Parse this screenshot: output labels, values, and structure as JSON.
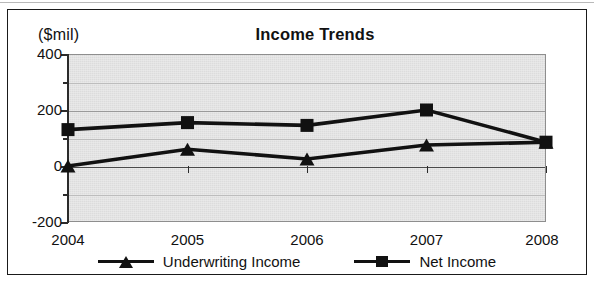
{
  "chart_data": {
    "type": "line",
    "title": "Income Trends",
    "xlabel": "",
    "ylabel": "($mil)",
    "ylim": [
      -200,
      400
    ],
    "yticks": [
      -200,
      0,
      200,
      400
    ],
    "ytick_labels": [
      "-200",
      "0",
      "200",
      "400"
    ],
    "yminor_ticks": [
      -100,
      100,
      300
    ],
    "grid": true,
    "legend_position": "bottom",
    "categories": [
      "2004",
      "2005",
      "2006",
      "2007",
      "2008"
    ],
    "series": [
      {
        "name": "Underwriting Income",
        "marker": "triangle",
        "color": "#111111",
        "values": [
          0,
          60,
          25,
          75,
          85
        ]
      },
      {
        "name": "Net Income",
        "marker": "square",
        "color": "#111111",
        "values": [
          130,
          155,
          145,
          200,
          85
        ]
      }
    ]
  },
  "axis_unit_label": "($mil)",
  "title": "Income Trends",
  "y_labels": [
    "400",
    "200",
    "0",
    "-200"
  ],
  "x_labels": [
    "2004",
    "2005",
    "2006",
    "2007",
    "2008"
  ],
  "legend": [
    {
      "label": "Underwriting Income",
      "marker": "triangle-marker"
    },
    {
      "label": "Net Income",
      "marker": "square-marker"
    }
  ],
  "colors": {
    "plot_background": "#dcdcdc",
    "series": "#111111",
    "frame": "#1a1a1a",
    "gridline": "#9a9a9a"
  }
}
